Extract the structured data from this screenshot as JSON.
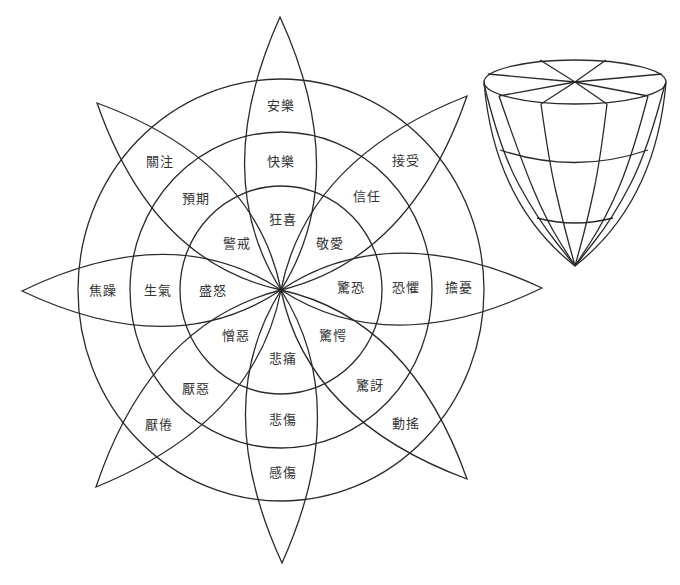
{
  "diagram": {
    "center": {
      "x": 281,
      "y": 290
    },
    "rings": [
      {
        "name": "outer",
        "rx": 203,
        "ry": 211
      },
      {
        "name": "middle",
        "rx": 151,
        "ry": 158
      },
      {
        "name": "inner",
        "rx": 101,
        "ry": 104
      }
    ],
    "petals": [
      {
        "id": "joy",
        "tip": {
          "x": 280,
          "y": 17
        },
        "labels": [
          {
            "text": "安樂",
            "x": 281,
            "y": 104,
            "ring": "outer"
          },
          {
            "text": "快樂",
            "x": 281,
            "y": 160,
            "ring": "middle"
          },
          {
            "text": "狂喜",
            "x": 283,
            "y": 218,
            "ring": "inner"
          }
        ]
      },
      {
        "id": "trust",
        "tip": {
          "x": 467,
          "y": 96
        },
        "labels": [
          {
            "text": "接受",
            "x": 406,
            "y": 159,
            "ring": "outer"
          },
          {
            "text": "信任",
            "x": 367,
            "y": 195,
            "ring": "middle"
          },
          {
            "text": "敬愛",
            "x": 330,
            "y": 242,
            "ring": "inner"
          }
        ]
      },
      {
        "id": "fear",
        "tip": {
          "x": 542,
          "y": 288
        },
        "labels": [
          {
            "text": "擔憂",
            "x": 459,
            "y": 286,
            "ring": "outer"
          },
          {
            "text": "恐懼",
            "x": 406,
            "y": 286,
            "ring": "middle"
          },
          {
            "text": "驚恐",
            "x": 351,
            "y": 286,
            "ring": "inner"
          }
        ]
      },
      {
        "id": "surprise",
        "tip": {
          "x": 467,
          "y": 479
        },
        "labels": [
          {
            "text": "動搖",
            "x": 406,
            "y": 422,
            "ring": "outer"
          },
          {
            "text": "驚訝",
            "x": 370,
            "y": 384,
            "ring": "middle"
          },
          {
            "text": "驚愕",
            "x": 333,
            "y": 334,
            "ring": "inner"
          }
        ]
      },
      {
        "id": "sadness",
        "tip": {
          "x": 282,
          "y": 563
        },
        "labels": [
          {
            "text": "感傷",
            "x": 283,
            "y": 471,
            "ring": "outer"
          },
          {
            "text": "悲傷",
            "x": 283,
            "y": 418,
            "ring": "middle"
          },
          {
            "text": "悲痛",
            "x": 283,
            "y": 357,
            "ring": "inner"
          }
        ]
      },
      {
        "id": "disgust",
        "tip": {
          "x": 96,
          "y": 487
        },
        "labels": [
          {
            "text": "厭倦",
            "x": 159,
            "y": 423,
            "ring": "outer"
          },
          {
            "text": "厭惡",
            "x": 196,
            "y": 387,
            "ring": "middle"
          },
          {
            "text": "憎惡",
            "x": 236,
            "y": 334,
            "ring": "inner"
          }
        ]
      },
      {
        "id": "anger",
        "tip": {
          "x": 22,
          "y": 291
        },
        "labels": [
          {
            "text": "焦躁",
            "x": 103,
            "y": 289,
            "ring": "outer"
          },
          {
            "text": "生氣",
            "x": 158,
            "y": 289,
            "ring": "middle"
          },
          {
            "text": "盛怒",
            "x": 213,
            "y": 289,
            "ring": "inner"
          }
        ]
      },
      {
        "id": "anticipation",
        "tip": {
          "x": 97,
          "y": 103
        },
        "labels": [
          {
            "text": "關注",
            "x": 160,
            "y": 160,
            "ring": "outer"
          },
          {
            "text": "預期",
            "x": 196,
            "y": 197,
            "ring": "middle"
          },
          {
            "text": "警戒",
            "x": 237,
            "y": 242,
            "ring": "inner"
          }
        ]
      }
    ],
    "petal_shape": {
      "ctrl_along": 0.42,
      "ctrl_offset": 72
    }
  },
  "cone": {
    "top_ellipse": {
      "cx": 575,
      "cy": 82,
      "rx": 91,
      "ry": 22
    },
    "apex": {
      "x": 575,
      "y": 266
    },
    "spokes": [
      {
        "x": 540,
        "y": 60
      },
      {
        "x": 606,
        "y": 60
      },
      {
        "x": 662,
        "y": 74
      },
      {
        "x": 648,
        "y": 96
      },
      {
        "x": 607,
        "y": 104
      },
      {
        "x": 541,
        "y": 104
      },
      {
        "x": 499,
        "y": 96
      },
      {
        "x": 488,
        "y": 74
      }
    ],
    "meridians": [
      {
        "top": {
          "x": 484,
          "y": 84
        },
        "mid1": {
          "x": 500,
          "y": 150
        },
        "mid2": {
          "x": 537,
          "y": 218
        }
      },
      {
        "top": {
          "x": 499,
          "y": 96
        },
        "mid1": {
          "x": 520,
          "y": 157
        },
        "mid2": {
          "x": 546,
          "y": 220
        }
      },
      {
        "top": {
          "x": 541,
          "y": 104
        },
        "mid1": {
          "x": 549,
          "y": 162
        },
        "mid2": {
          "x": 563,
          "y": 222
        }
      },
      {
        "top": {
          "x": 607,
          "y": 104
        },
        "mid1": {
          "x": 600,
          "y": 162
        },
        "mid2": {
          "x": 587,
          "y": 222
        }
      },
      {
        "top": {
          "x": 648,
          "y": 96
        },
        "mid1": {
          "x": 632,
          "y": 157
        },
        "mid2": {
          "x": 605,
          "y": 220
        }
      },
      {
        "top": {
          "x": 665,
          "y": 84
        },
        "mid1": {
          "x": 648,
          "y": 150
        },
        "mid2": {
          "x": 613,
          "y": 218
        }
      }
    ],
    "bands": [
      {
        "left": {
          "x": 500,
          "y": 150
        },
        "ctrl": {
          "x": 575,
          "y": 175
        },
        "right": {
          "x": 648,
          "y": 150
        }
      },
      {
        "left": {
          "x": 537,
          "y": 218
        },
        "ctrl": {
          "x": 575,
          "y": 228
        },
        "right": {
          "x": 613,
          "y": 218
        }
      }
    ]
  }
}
